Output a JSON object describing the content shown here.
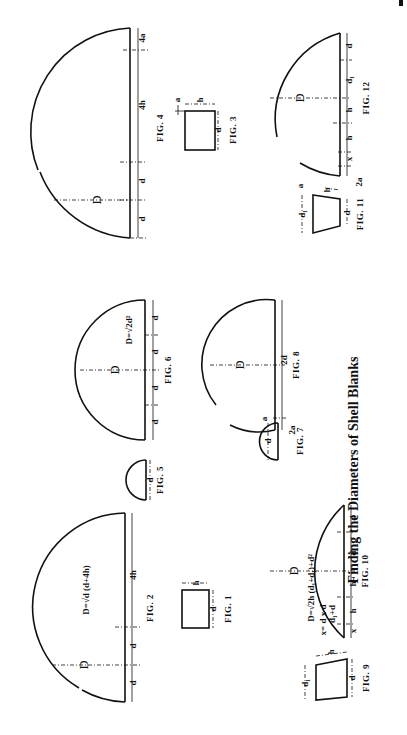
{
  "title": "Finding the Diameters of Shell Blanks",
  "figures": [
    {
      "id": "fig1",
      "label": "FIG. 1",
      "dims": [
        "d",
        "h"
      ],
      "shape": "rectangle (cylindrical shell)"
    },
    {
      "id": "fig2",
      "label": "FIG. 2",
      "formula": "D = √d (d+4h)",
      "dims": [
        "D",
        "d",
        "d",
        "4h"
      ]
    },
    {
      "id": "fig3",
      "label": "FIG. 3",
      "dims": [
        "d",
        "h",
        "a"
      ],
      "shape": "rectangle with flange"
    },
    {
      "id": "fig4",
      "label": "FIG. 4",
      "dims": [
        "D",
        "d",
        "d",
        "4h",
        "4a"
      ]
    },
    {
      "id": "fig5",
      "label": "FIG. 5",
      "dims": [
        "d"
      ],
      "shape": "hemisphere"
    },
    {
      "id": "fig6",
      "label": "FIG. 6",
      "formula": "D = √2d²",
      "dims": [
        "D",
        "d",
        "d",
        "d",
        "d"
      ]
    },
    {
      "id": "fig7",
      "label": "FIG. 7",
      "dims": [
        "d",
        "a"
      ],
      "shape": "hemisphere with flange"
    },
    {
      "id": "fig8",
      "label": "FIG. 8",
      "dims": [
        "D",
        "2d",
        "2a"
      ]
    },
    {
      "id": "fig9",
      "label": "FIG. 9",
      "dims": [
        "d1",
        "h",
        "d"
      ],
      "shape": "tapered shell"
    },
    {
      "id": "fig10",
      "label": "FIG. 10",
      "formula": "D = √2h (d + d1) + d²",
      "formula2": "x = d × d / d1 + d",
      "dims": [
        "D",
        "x",
        "h",
        "h",
        "d1",
        "d"
      ]
    },
    {
      "id": "fig11",
      "label": "FIG. 11",
      "dims": [
        "d1",
        "h",
        "d",
        "a"
      ],
      "shape": "tapered shell with flange"
    },
    {
      "id": "fig12",
      "label": "FIG. 12",
      "dims": [
        "D",
        "x",
        "h",
        "h",
        "d1",
        "d",
        "2a"
      ]
    }
  ],
  "text": {
    "f1": "FIG. 1",
    "f2": "FIG. 2",
    "f3": "FIG. 3",
    "f4": "FIG. 4",
    "f5": "FIG. 5",
    "f6": "FIG. 6",
    "f7": "FIG. 7",
    "f8": "FIG. 8",
    "f9": "FIG. 9",
    "f10": "FIG. 10",
    "f11": "FIG. 11",
    "f12": "FIG. 12",
    "D": "D",
    "d": "d",
    "d1": "d₁",
    "h": "h",
    "a": "a",
    "x": "x",
    "h4": "4h",
    "d2": "2d",
    "a2": "2a",
    "a4": "4a",
    "formula2": "D=√d (d+4h)",
    "formula6": "D=√2d²",
    "formula10a": "D=√2h (d₁+d₁)+d²",
    "formula10b": "x= d x d",
    "formula10c": "d₁+d"
  }
}
